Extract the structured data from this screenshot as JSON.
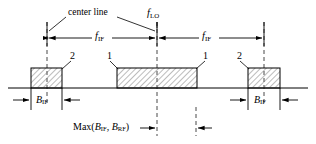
{
  "figure": {
    "type": "spectrum-block-diagram",
    "title_text": "",
    "background_color": "#ffffff",
    "line_color": "#000000",
    "hatch_color": "#555555"
  },
  "labels": {
    "center_line": "center line",
    "f_lo": {
      "base": "f",
      "sub": "LO"
    },
    "f_if_left": {
      "base": "f",
      "sub": "IF"
    },
    "f_if_right": {
      "base": "f",
      "sub": "IF"
    },
    "b_if_left": {
      "base": "B",
      "sub": "IF"
    },
    "b_if_right": {
      "base": "B",
      "sub": "IF"
    },
    "callout_left": "2",
    "callout_center_left": "1",
    "callout_center_right": "1",
    "callout_right": "2",
    "max_expr": {
      "prefix": "Max(",
      "first_base": "B",
      "first_sub": "IF",
      "separator": ", ",
      "second_base": "B",
      "second_sub": "RF",
      "suffix": ")"
    }
  },
  "geometry": {
    "baseline_y": 88,
    "blocks": [
      {
        "name": "left-sideband-block",
        "x": 31,
        "y": 68,
        "width": 31,
        "height": 20
      },
      {
        "name": "center-passband-block",
        "x": 117,
        "y": 68,
        "width": 80,
        "height": 20
      },
      {
        "name": "right-sideband-block",
        "x": 248,
        "y": 68,
        "width": 32,
        "height": 20
      }
    ],
    "dashed_lines": [
      {
        "name": "left-center-line",
        "x": 47,
        "y1": 22,
        "y2": 105
      },
      {
        "name": "lo-center-line",
        "x": 157,
        "y1": 22,
        "y2": 136
      },
      {
        "name": "right-center-line",
        "x": 264,
        "y1": 22,
        "y2": 105
      }
    ]
  }
}
